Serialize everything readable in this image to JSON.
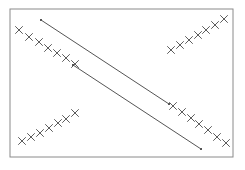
{
  "figure": {
    "title": "",
    "background_color": "#ffffff",
    "width": 245,
    "height": 170
  },
  "frame": {
    "name": "plot-border",
    "x": 10,
    "y": 9,
    "width": 223,
    "height": 148,
    "stroke_color": "#8a8a8a",
    "stroke_width": 1,
    "fill": "none"
  },
  "chart_data": {
    "type": "scatter",
    "title": "",
    "xlabel": "",
    "ylabel": "",
    "grid": false,
    "legend": null,
    "axis_ticks": false,
    "tick_labels": [],
    "xlim": [
      10,
      233
    ],
    "ylim": [
      9,
      157
    ],
    "marker": "x",
    "marker_color": "#4a4a4a",
    "marker_size": 7,
    "annotations": [],
    "series": [
      {
        "name": "upper-left-cluster",
        "marker": "x",
        "color": "#4a4a4a",
        "points": [
          [
            19,
            30
          ],
          [
            29,
            37
          ],
          [
            39,
            42
          ],
          [
            48,
            48
          ],
          [
            57,
            53
          ],
          [
            66,
            58
          ],
          [
            75,
            64
          ]
        ]
      },
      {
        "name": "lower-left-cluster",
        "marker": "x",
        "color": "#4a4a4a",
        "points": [
          [
            22,
            141
          ],
          [
            31,
            137
          ],
          [
            40,
            133
          ],
          [
            49,
            128
          ],
          [
            58,
            123
          ],
          [
            66,
            119
          ],
          [
            75,
            113
          ]
        ]
      },
      {
        "name": "upper-right-cluster",
        "marker": "x",
        "color": "#4a4a4a",
        "points": [
          [
            171,
            50
          ],
          [
            180,
            45
          ],
          [
            189,
            40
          ],
          [
            198,
            35
          ],
          [
            206,
            30
          ],
          [
            215,
            25
          ],
          [
            224,
            19
          ]
        ]
      },
      {
        "name": "lower-right-cluster",
        "marker": "x",
        "color": "#4a4a4a",
        "points": [
          [
            173,
            106
          ],
          [
            182,
            112
          ],
          [
            191,
            118
          ],
          [
            199,
            124
          ],
          [
            208,
            130
          ],
          [
            217,
            137
          ],
          [
            226,
            143
          ]
        ]
      }
    ],
    "lines": [
      {
        "name": "upper-diagonal-line",
        "x1": 41,
        "y1": 20,
        "x2": 169,
        "y2": 104,
        "color": "#555555",
        "width": 1,
        "endpoint_markers": true
      },
      {
        "name": "lower-diagonal-line",
        "x1": 73,
        "y1": 65,
        "x2": 201,
        "y2": 149,
        "color": "#555555",
        "width": 1,
        "endpoint_markers": true
      }
    ]
  }
}
